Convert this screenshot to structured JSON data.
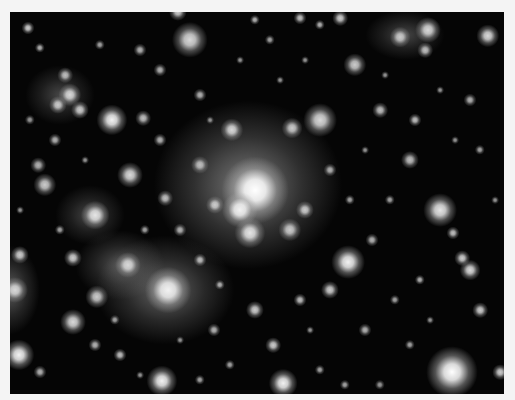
{
  "image": {
    "subject": "galaxy cluster deep-field photograph",
    "background_color": "#f4f4f4",
    "frame": {
      "x": 10,
      "y": 12,
      "width": 494,
      "height": 382,
      "color": "#050505"
    }
  },
  "glows": [
    {
      "x": 248,
      "y": 185,
      "rx": 95,
      "ry": 85,
      "a": 0.55
    },
    {
      "x": 165,
      "y": 290,
      "rx": 70,
      "ry": 55,
      "a": 0.45
    },
    {
      "x": 120,
      "y": 265,
      "rx": 45,
      "ry": 35,
      "a": 0.35
    },
    {
      "x": 60,
      "y": 95,
      "rx": 35,
      "ry": 30,
      "a": 0.3
    },
    {
      "x": 10,
      "y": 290,
      "rx": 30,
      "ry": 45,
      "a": 0.4
    },
    {
      "x": 405,
      "y": 35,
      "rx": 40,
      "ry": 25,
      "a": 0.3
    },
    {
      "x": 90,
      "y": 215,
      "rx": 35,
      "ry": 30,
      "a": 0.3
    }
  ],
  "objects": [
    {
      "x": 255,
      "y": 190,
      "r": 26,
      "b": 1.0
    },
    {
      "x": 240,
      "y": 210,
      "r": 14,
      "b": 0.95
    },
    {
      "x": 232,
      "y": 130,
      "r": 9,
      "b": 0.85
    },
    {
      "x": 292,
      "y": 128,
      "r": 8,
      "b": 0.8
    },
    {
      "x": 320,
      "y": 120,
      "r": 13,
      "b": 0.85
    },
    {
      "x": 250,
      "y": 233,
      "r": 12,
      "b": 0.9
    },
    {
      "x": 290,
      "y": 230,
      "r": 9,
      "b": 0.8
    },
    {
      "x": 305,
      "y": 210,
      "r": 7,
      "b": 0.8
    },
    {
      "x": 215,
      "y": 205,
      "r": 7,
      "b": 0.8
    },
    {
      "x": 200,
      "y": 165,
      "r": 7,
      "b": 0.75
    },
    {
      "x": 190,
      "y": 40,
      "r": 14,
      "b": 0.85
    },
    {
      "x": 178,
      "y": 12,
      "r": 7,
      "b": 0.8
    },
    {
      "x": 112,
      "y": 120,
      "r": 12,
      "b": 0.95
    },
    {
      "x": 70,
      "y": 95,
      "r": 9,
      "b": 0.85
    },
    {
      "x": 58,
      "y": 105,
      "r": 7,
      "b": 0.8
    },
    {
      "x": 80,
      "y": 110,
      "r": 7,
      "b": 0.8
    },
    {
      "x": 65,
      "y": 75,
      "r": 6,
      "b": 0.75
    },
    {
      "x": 143,
      "y": 118,
      "r": 6,
      "b": 0.75
    },
    {
      "x": 130,
      "y": 175,
      "r": 10,
      "b": 0.85
    },
    {
      "x": 95,
      "y": 215,
      "r": 11,
      "b": 0.9
    },
    {
      "x": 45,
      "y": 185,
      "r": 9,
      "b": 0.8
    },
    {
      "x": 38,
      "y": 165,
      "r": 6,
      "b": 0.7
    },
    {
      "x": 165,
      "y": 198,
      "r": 6,
      "b": 0.75
    },
    {
      "x": 168,
      "y": 290,
      "r": 18,
      "b": 0.95
    },
    {
      "x": 128,
      "y": 265,
      "r": 10,
      "b": 0.85
    },
    {
      "x": 97,
      "y": 297,
      "r": 9,
      "b": 0.8
    },
    {
      "x": 73,
      "y": 322,
      "r": 10,
      "b": 0.85
    },
    {
      "x": 73,
      "y": 258,
      "r": 7,
      "b": 0.8
    },
    {
      "x": 19,
      "y": 355,
      "r": 12,
      "b": 0.95
    },
    {
      "x": 15,
      "y": 290,
      "r": 10,
      "b": 0.85
    },
    {
      "x": 20,
      "y": 255,
      "r": 7,
      "b": 0.8
    },
    {
      "x": 162,
      "y": 381,
      "r": 12,
      "b": 0.95
    },
    {
      "x": 283,
      "y": 383,
      "r": 11,
      "b": 0.95
    },
    {
      "x": 273,
      "y": 345,
      "r": 6,
      "b": 0.8
    },
    {
      "x": 348,
      "y": 262,
      "r": 13,
      "b": 0.95
    },
    {
      "x": 440,
      "y": 210,
      "r": 13,
      "b": 0.9
    },
    {
      "x": 452,
      "y": 372,
      "r": 20,
      "b": 1.0
    },
    {
      "x": 470,
      "y": 270,
      "r": 8,
      "b": 0.85
    },
    {
      "x": 462,
      "y": 258,
      "r": 6,
      "b": 0.8
    },
    {
      "x": 453,
      "y": 233,
      "r": 5,
      "b": 0.75
    },
    {
      "x": 488,
      "y": 36,
      "r": 9,
      "b": 0.85
    },
    {
      "x": 428,
      "y": 30,
      "r": 10,
      "b": 0.85
    },
    {
      "x": 400,
      "y": 37,
      "r": 8,
      "b": 0.8
    },
    {
      "x": 355,
      "y": 65,
      "r": 9,
      "b": 0.8
    },
    {
      "x": 425,
      "y": 50,
      "r": 6,
      "b": 0.75
    },
    {
      "x": 410,
      "y": 160,
      "r": 7,
      "b": 0.75
    },
    {
      "x": 480,
      "y": 310,
      "r": 6,
      "b": 0.8
    },
    {
      "x": 500,
      "y": 372,
      "r": 6,
      "b": 0.8
    },
    {
      "x": 330,
      "y": 290,
      "r": 7,
      "b": 0.8
    },
    {
      "x": 300,
      "y": 300,
      "r": 5,
      "b": 0.75
    },
    {
      "x": 365,
      "y": 330,
      "r": 5,
      "b": 0.7
    },
    {
      "x": 255,
      "y": 310,
      "r": 7,
      "b": 0.8
    },
    {
      "x": 214,
      "y": 330,
      "r": 5,
      "b": 0.7
    },
    {
      "x": 120,
      "y": 355,
      "r": 5,
      "b": 0.75
    },
    {
      "x": 95,
      "y": 345,
      "r": 5,
      "b": 0.7
    },
    {
      "x": 40,
      "y": 372,
      "r": 5,
      "b": 0.7
    },
    {
      "x": 28,
      "y": 28,
      "r": 5,
      "b": 0.8
    },
    {
      "x": 40,
      "y": 48,
      "r": 4,
      "b": 0.7
    },
    {
      "x": 300,
      "y": 18,
      "r": 5,
      "b": 0.75
    },
    {
      "x": 340,
      "y": 18,
      "r": 6,
      "b": 0.8
    },
    {
      "x": 255,
      "y": 20,
      "r": 4,
      "b": 0.7
    },
    {
      "x": 270,
      "y": 40,
      "r": 4,
      "b": 0.65
    },
    {
      "x": 320,
      "y": 25,
      "r": 4,
      "b": 0.7
    },
    {
      "x": 380,
      "y": 110,
      "r": 6,
      "b": 0.75
    },
    {
      "x": 415,
      "y": 120,
      "r": 5,
      "b": 0.75
    },
    {
      "x": 390,
      "y": 200,
      "r": 4,
      "b": 0.65
    },
    {
      "x": 372,
      "y": 240,
      "r": 5,
      "b": 0.7
    },
    {
      "x": 420,
      "y": 280,
      "r": 4,
      "b": 0.7
    },
    {
      "x": 395,
      "y": 300,
      "r": 4,
      "b": 0.65
    },
    {
      "x": 410,
      "y": 345,
      "r": 4,
      "b": 0.65
    },
    {
      "x": 480,
      "y": 150,
      "r": 4,
      "b": 0.65
    },
    {
      "x": 470,
      "y": 100,
      "r": 5,
      "b": 0.7
    },
    {
      "x": 160,
      "y": 70,
      "r": 5,
      "b": 0.7
    },
    {
      "x": 140,
      "y": 50,
      "r": 5,
      "b": 0.7
    },
    {
      "x": 100,
      "y": 45,
      "r": 4,
      "b": 0.65
    },
    {
      "x": 200,
      "y": 95,
      "r": 5,
      "b": 0.7
    },
    {
      "x": 55,
      "y": 140,
      "r": 5,
      "b": 0.7
    },
    {
      "x": 30,
      "y": 120,
      "r": 4,
      "b": 0.6
    },
    {
      "x": 160,
      "y": 140,
      "r": 5,
      "b": 0.7
    },
    {
      "x": 180,
      "y": 230,
      "r": 5,
      "b": 0.7
    },
    {
      "x": 200,
      "y": 260,
      "r": 5,
      "b": 0.75
    },
    {
      "x": 220,
      "y": 285,
      "r": 4,
      "b": 0.7
    },
    {
      "x": 330,
      "y": 170,
      "r": 5,
      "b": 0.7
    },
    {
      "x": 350,
      "y": 200,
      "r": 4,
      "b": 0.65
    },
    {
      "x": 230,
      "y": 365,
      "r": 4,
      "b": 0.65
    },
    {
      "x": 200,
      "y": 380,
      "r": 4,
      "b": 0.65
    },
    {
      "x": 320,
      "y": 370,
      "r": 4,
      "b": 0.65
    },
    {
      "x": 345,
      "y": 385,
      "r": 4,
      "b": 0.65
    },
    {
      "x": 380,
      "y": 385,
      "r": 4,
      "b": 0.6
    },
    {
      "x": 60,
      "y": 230,
      "r": 4,
      "b": 0.65
    },
    {
      "x": 145,
      "y": 230,
      "r": 4,
      "b": 0.65
    },
    {
      "x": 115,
      "y": 320,
      "r": 4,
      "b": 0.65
    },
    {
      "x": 240,
      "y": 60,
      "r": 3,
      "b": 0.6
    },
    {
      "x": 280,
      "y": 80,
      "r": 3,
      "b": 0.6
    },
    {
      "x": 365,
      "y": 150,
      "r": 3,
      "b": 0.6
    },
    {
      "x": 440,
      "y": 90,
      "r": 3,
      "b": 0.6
    },
    {
      "x": 455,
      "y": 140,
      "r": 3,
      "b": 0.6
    },
    {
      "x": 495,
      "y": 200,
      "r": 3,
      "b": 0.6
    },
    {
      "x": 430,
      "y": 320,
      "r": 3,
      "b": 0.6
    },
    {
      "x": 310,
      "y": 330,
      "r": 3,
      "b": 0.6
    },
    {
      "x": 180,
      "y": 340,
      "r": 3,
      "b": 0.6
    },
    {
      "x": 140,
      "y": 375,
      "r": 3,
      "b": 0.6
    },
    {
      "x": 85,
      "y": 160,
      "r": 3,
      "b": 0.6
    },
    {
      "x": 20,
      "y": 210,
      "r": 3,
      "b": 0.6
    },
    {
      "x": 210,
      "y": 120,
      "r": 3,
      "b": 0.6
    },
    {
      "x": 305,
      "y": 60,
      "r": 3,
      "b": 0.6
    },
    {
      "x": 385,
      "y": 75,
      "r": 3,
      "b": 0.6
    }
  ]
}
